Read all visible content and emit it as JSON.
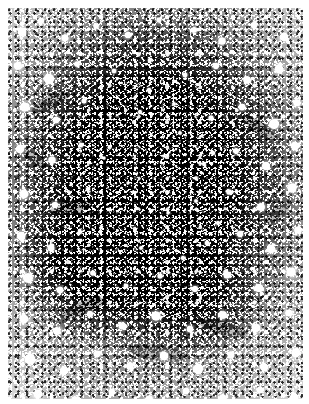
{
  "image": {
    "kind": "astronomical-photograph",
    "subject_caption": "Dense star field with large dark central cloud",
    "medium": "halftone-reproduction of photographic plate",
    "palette": {
      "paper_white": "#ffffff",
      "star_white": "#ffffff",
      "field_grey": "#8e8e8e",
      "mid_grey": "#6a6a6a",
      "core_black": "#050505"
    },
    "geometry": {
      "width": 309,
      "height": 404,
      "margin_left": 8,
      "margin_top": 8,
      "margin_right": 6,
      "margin_bottom": 5
    },
    "dark_cloud": {
      "center_x_pct": 49,
      "center_y_pct": 44,
      "radius_x_pct": 58,
      "radius_y_pct": 52,
      "lower_left_lobe_x_pct": 30,
      "lower_left_lobe_y_pct": 66
    },
    "bright_stars": [
      {
        "cx": 14,
        "cy": 24,
        "r": 4.2
      },
      {
        "cx": 33,
        "cy": 13,
        "r": 3.0
      },
      {
        "cx": 57,
        "cy": 30,
        "r": 3.4
      },
      {
        "cx": 88,
        "cy": 18,
        "r": 2.6
      },
      {
        "cx": 120,
        "cy": 27,
        "r": 3.1
      },
      {
        "cx": 151,
        "cy": 12,
        "r": 2.4
      },
      {
        "cx": 186,
        "cy": 22,
        "r": 2.8
      },
      {
        "cx": 214,
        "cy": 33,
        "r": 3.6
      },
      {
        "cx": 246,
        "cy": 17,
        "r": 3.0
      },
      {
        "cx": 276,
        "cy": 29,
        "r": 4.0
      },
      {
        "cx": 10,
        "cy": 58,
        "r": 3.8
      },
      {
        "cx": 41,
        "cy": 71,
        "r": 5.0
      },
      {
        "cx": 69,
        "cy": 56,
        "r": 2.6
      },
      {
        "cx": 106,
        "cy": 63,
        "r": 2.2
      },
      {
        "cx": 142,
        "cy": 52,
        "r": 2.0
      },
      {
        "cx": 177,
        "cy": 67,
        "r": 2.3
      },
      {
        "cx": 208,
        "cy": 58,
        "r": 2.9
      },
      {
        "cx": 239,
        "cy": 72,
        "r": 3.7
      },
      {
        "cx": 271,
        "cy": 61,
        "r": 4.4
      },
      {
        "cx": 17,
        "cy": 99,
        "r": 4.6
      },
      {
        "cx": 48,
        "cy": 112,
        "r": 3.2
      },
      {
        "cx": 76,
        "cy": 93,
        "r": 2.4
      },
      {
        "cx": 132,
        "cy": 104,
        "r": 1.9
      },
      {
        "cx": 166,
        "cy": 96,
        "r": 1.8
      },
      {
        "cx": 203,
        "cy": 110,
        "r": 2.5
      },
      {
        "cx": 234,
        "cy": 99,
        "r": 3.3
      },
      {
        "cx": 266,
        "cy": 116,
        "r": 4.8
      },
      {
        "cx": 289,
        "cy": 95,
        "r": 3.4
      },
      {
        "cx": 12,
        "cy": 141,
        "r": 4.0
      },
      {
        "cx": 44,
        "cy": 152,
        "r": 3.6
      },
      {
        "cx": 73,
        "cy": 137,
        "r": 2.2
      },
      {
        "cx": 156,
        "cy": 148,
        "r": 1.6
      },
      {
        "cx": 196,
        "cy": 156,
        "r": 1.9
      },
      {
        "cx": 228,
        "cy": 143,
        "r": 2.8
      },
      {
        "cx": 258,
        "cy": 158,
        "r": 3.9
      },
      {
        "cx": 287,
        "cy": 138,
        "r": 4.2
      },
      {
        "cx": 16,
        "cy": 186,
        "r": 4.4
      },
      {
        "cx": 47,
        "cy": 197,
        "r": 3.1
      },
      {
        "cx": 80,
        "cy": 181,
        "r": 2.0
      },
      {
        "cx": 188,
        "cy": 193,
        "r": 1.8
      },
      {
        "cx": 221,
        "cy": 184,
        "r": 2.6
      },
      {
        "cx": 253,
        "cy": 199,
        "r": 3.8
      },
      {
        "cx": 284,
        "cy": 180,
        "r": 4.6
      },
      {
        "cx": 13,
        "cy": 228,
        "r": 4.1
      },
      {
        "cx": 43,
        "cy": 240,
        "r": 3.4
      },
      {
        "cx": 72,
        "cy": 224,
        "r": 2.1
      },
      {
        "cx": 199,
        "cy": 235,
        "r": 2.2
      },
      {
        "cx": 232,
        "cy": 226,
        "r": 3.0
      },
      {
        "cx": 263,
        "cy": 241,
        "r": 4.2
      },
      {
        "cx": 290,
        "cy": 222,
        "r": 3.6
      },
      {
        "cx": 20,
        "cy": 270,
        "r": 4.8
      },
      {
        "cx": 52,
        "cy": 282,
        "r": 3.3
      },
      {
        "cx": 85,
        "cy": 265,
        "r": 2.6
      },
      {
        "cx": 118,
        "cy": 278,
        "r": 2.3
      },
      {
        "cx": 152,
        "cy": 268,
        "r": 2.5
      },
      {
        "cx": 187,
        "cy": 281,
        "r": 2.9
      },
      {
        "cx": 219,
        "cy": 267,
        "r": 3.4
      },
      {
        "cx": 251,
        "cy": 280,
        "r": 4.0
      },
      {
        "cx": 283,
        "cy": 264,
        "r": 4.5
      },
      {
        "cx": 16,
        "cy": 311,
        "r": 4.3
      },
      {
        "cx": 49,
        "cy": 323,
        "r": 3.7
      },
      {
        "cx": 82,
        "cy": 306,
        "r": 3.0
      },
      {
        "cx": 114,
        "cy": 318,
        "r": 3.4
      },
      {
        "cx": 148,
        "cy": 308,
        "r": 4.6
      },
      {
        "cx": 182,
        "cy": 321,
        "r": 3.2
      },
      {
        "cx": 215,
        "cy": 307,
        "r": 3.8
      },
      {
        "cx": 248,
        "cy": 320,
        "r": 4.1
      },
      {
        "cx": 281,
        "cy": 305,
        "r": 3.5
      },
      {
        "cx": 22,
        "cy": 351,
        "r": 5.2
      },
      {
        "cx": 56,
        "cy": 363,
        "r": 3.9
      },
      {
        "cx": 89,
        "cy": 346,
        "r": 3.3
      },
      {
        "cx": 122,
        "cy": 358,
        "r": 3.6
      },
      {
        "cx": 156,
        "cy": 348,
        "r": 4.0
      },
      {
        "cx": 190,
        "cy": 361,
        "r": 4.9
      },
      {
        "cx": 223,
        "cy": 347,
        "r": 3.4
      },
      {
        "cx": 256,
        "cy": 359,
        "r": 3.8
      },
      {
        "cx": 288,
        "cy": 345,
        "r": 4.4
      },
      {
        "cx": 30,
        "cy": 386,
        "r": 4.0
      },
      {
        "cx": 67,
        "cy": 392,
        "r": 3.4
      },
      {
        "cx": 104,
        "cy": 384,
        "r": 3.0
      },
      {
        "cx": 141,
        "cy": 391,
        "r": 3.6
      },
      {
        "cx": 178,
        "cy": 383,
        "r": 3.1
      },
      {
        "cx": 215,
        "cy": 390,
        "r": 3.5
      },
      {
        "cx": 252,
        "cy": 382,
        "r": 3.2
      },
      {
        "cx": 286,
        "cy": 389,
        "r": 3.8
      },
      {
        "cx": 141,
        "cy": 82,
        "r": 2.1
      },
      {
        "cx": 172,
        "cy": 125,
        "r": 1.7
      },
      {
        "cx": 205,
        "cy": 145,
        "r": 2.0
      },
      {
        "cx": 188,
        "cy": 170,
        "r": 1.6
      },
      {
        "cx": 160,
        "cy": 205,
        "r": 1.5
      },
      {
        "cx": 210,
        "cy": 215,
        "r": 1.9
      },
      {
        "cx": 120,
        "cy": 175,
        "r": 1.4
      },
      {
        "cx": 96,
        "cy": 150,
        "r": 1.5
      },
      {
        "cx": 133,
        "cy": 240,
        "r": 1.8
      },
      {
        "cx": 175,
        "cy": 250,
        "r": 2.1
      }
    ]
  }
}
